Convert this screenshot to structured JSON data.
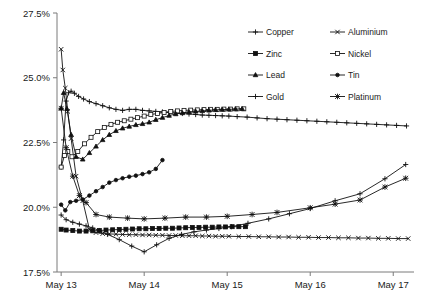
{
  "chart_data": {
    "type": "line",
    "title": "",
    "subtitle": "",
    "xlabel": "",
    "ylabel": "",
    "grid": false,
    "legend_position": "top-right",
    "legend_columns": 2,
    "x_tick_labels": [
      "May 13",
      "May 14",
      "May 15",
      "May 16",
      "May 17"
    ],
    "x_tick_values": [
      13,
      14,
      15,
      16,
      17
    ],
    "xlim": [
      12.95,
      17.25
    ],
    "y_tick_labels": [
      "17.5%",
      "20.0%",
      "22.5%",
      "25.0%",
      "27.5%"
    ],
    "y_tick_values": [
      17.5,
      20.0,
      22.5,
      25.0,
      27.5
    ],
    "ylim": [
      17.5,
      27.5
    ],
    "y_unit": "%",
    "series": [
      {
        "name": "Copper",
        "marker": "plus",
        "x": [
          13.0,
          13.03,
          13.06,
          13.09,
          13.12,
          13.16,
          13.21,
          13.27,
          13.34,
          13.42,
          13.5,
          13.58,
          13.66,
          13.74,
          13.82,
          13.9,
          13.98,
          14.06,
          14.14,
          14.22,
          14.3,
          14.38,
          14.46,
          14.54,
          14.62,
          14.7,
          14.78,
          14.86,
          14.94,
          15.02,
          15.12,
          15.24,
          15.36,
          15.48,
          15.6,
          15.72,
          15.84,
          15.96,
          16.08,
          16.2,
          16.32,
          16.44,
          16.56,
          16.68,
          16.8,
          16.92,
          17.04,
          17.16
        ],
        "y": [
          21.55,
          22.6,
          24.1,
          24.42,
          24.48,
          24.4,
          24.28,
          24.18,
          24.08,
          24.0,
          23.92,
          23.84,
          23.78,
          23.74,
          23.78,
          23.78,
          23.74,
          23.72,
          23.7,
          23.68,
          23.66,
          23.64,
          23.62,
          23.6,
          23.58,
          23.56,
          23.55,
          23.54,
          23.53,
          23.52,
          23.5,
          23.48,
          23.45,
          23.42,
          23.4,
          23.38,
          23.36,
          23.34,
          23.32,
          23.3,
          23.28,
          23.26,
          23.24,
          23.22,
          23.2,
          23.18,
          23.16,
          23.14
        ]
      },
      {
        "name": "Aluminium",
        "marker": "cross",
        "x": [
          13.0,
          13.02,
          13.05,
          13.08,
          13.12,
          13.18,
          13.26,
          13.34,
          13.42,
          13.5,
          13.58,
          13.66,
          13.74,
          13.82,
          13.9,
          13.98,
          14.06,
          14.14,
          14.22,
          14.3,
          14.38,
          14.46,
          14.54,
          14.62,
          14.7,
          14.78,
          14.86,
          14.94,
          15.02,
          15.14,
          15.26,
          15.38,
          15.5,
          15.62,
          15.74,
          15.86,
          15.98,
          16.1,
          16.22,
          16.34,
          16.46,
          16.58,
          16.7,
          16.82,
          16.94,
          17.06,
          17.18
        ],
        "y": [
          26.1,
          25.3,
          24.6,
          23.7,
          22.65,
          21.2,
          20.25,
          19.15,
          19.02,
          18.98,
          18.97,
          18.96,
          18.95,
          18.94,
          18.94,
          18.93,
          18.93,
          18.92,
          18.92,
          18.91,
          18.91,
          18.9,
          18.9,
          18.9,
          18.89,
          18.89,
          18.88,
          18.88,
          18.88,
          18.87,
          18.87,
          18.86,
          18.86,
          18.85,
          18.85,
          18.84,
          18.84,
          18.83,
          18.83,
          18.82,
          18.82,
          18.81,
          18.81,
          18.8,
          18.8,
          18.79,
          18.79
        ]
      },
      {
        "name": "Zinc",
        "marker": "square",
        "x": [
          13.0,
          13.06,
          13.14,
          13.22,
          13.3,
          13.38,
          13.46,
          13.54,
          13.62,
          13.7,
          13.78,
          13.86,
          13.94,
          14.02,
          14.1,
          14.18,
          14.26,
          14.34,
          14.42,
          14.5,
          14.58,
          14.66,
          14.74,
          14.82,
          14.9,
          14.98,
          15.06,
          15.14,
          15.22
        ],
        "y": [
          19.15,
          19.12,
          19.1,
          19.08,
          19.08,
          19.09,
          19.1,
          19.12,
          19.13,
          19.14,
          19.15,
          19.16,
          19.17,
          19.17,
          19.18,
          19.18,
          19.19,
          19.19,
          19.2,
          19.21,
          19.22,
          19.22,
          19.23,
          19.23,
          19.24,
          19.24,
          19.25,
          19.25,
          19.25
        ]
      },
      {
        "name": "Nickel",
        "marker": "square-hollow",
        "x": [
          13.0,
          13.04,
          13.08,
          13.13,
          13.2,
          13.28,
          13.36,
          13.44,
          13.52,
          13.6,
          13.68,
          13.76,
          13.84,
          13.92,
          14.0,
          14.08,
          14.16,
          14.24,
          14.32,
          14.4,
          14.48,
          14.56,
          14.64,
          14.72,
          14.8,
          14.88,
          14.96,
          15.04,
          15.12,
          15.2
        ],
        "y": [
          21.55,
          22.0,
          22.15,
          21.95,
          22.15,
          22.45,
          22.7,
          22.92,
          23.08,
          23.2,
          23.28,
          23.34,
          23.4,
          23.46,
          23.52,
          23.58,
          23.62,
          23.66,
          23.7,
          23.72,
          23.74,
          23.75,
          23.76,
          23.77,
          23.78,
          23.78,
          23.79,
          23.79,
          23.8,
          23.8
        ]
      },
      {
        "name": "Lead",
        "marker": "triangle",
        "x": [
          13.0,
          13.03,
          13.07,
          13.12,
          13.18,
          13.26,
          13.34,
          13.42,
          13.5,
          13.58,
          13.66,
          13.74,
          13.82,
          13.9,
          13.98,
          14.06,
          14.14,
          14.22,
          14.3,
          14.38,
          14.46,
          14.54,
          14.62,
          14.7,
          14.78,
          14.86,
          14.94,
          15.02,
          15.1,
          15.18
        ],
        "y": [
          23.82,
          24.42,
          23.8,
          22.8,
          21.95,
          21.85,
          22.1,
          22.35,
          22.6,
          22.8,
          22.95,
          23.05,
          23.12,
          23.18,
          23.22,
          23.28,
          23.38,
          23.46,
          23.54,
          23.6,
          23.64,
          23.68,
          23.7,
          23.72,
          23.74,
          23.76,
          23.77,
          23.78,
          23.79,
          23.8
        ]
      },
      {
        "name": "Tin",
        "marker": "circle",
        "x": [
          13.0,
          13.05,
          13.11,
          13.18,
          13.26,
          13.34,
          13.42,
          13.5,
          13.58,
          13.66,
          13.74,
          13.82,
          13.9,
          13.98,
          14.06,
          14.14,
          14.22
        ],
        "y": [
          20.1,
          19.88,
          20.2,
          20.25,
          20.3,
          20.45,
          20.62,
          20.78,
          20.95,
          21.05,
          21.12,
          21.18,
          21.22,
          21.28,
          21.35,
          21.48,
          21.82
        ]
      },
      {
        "name": "Gold",
        "marker": "plus-thin",
        "x": [
          13.0,
          13.06,
          13.14,
          13.22,
          13.3,
          13.38,
          13.46,
          13.56,
          13.7,
          13.85,
          14.0,
          14.15,
          14.3,
          14.45,
          14.6,
          14.75,
          14.9,
          15.05,
          15.25,
          15.5,
          15.75,
          16.0,
          16.3,
          16.6,
          16.9,
          17.15
        ],
        "y": [
          19.7,
          19.52,
          19.42,
          19.35,
          19.28,
          19.2,
          19.1,
          18.95,
          18.75,
          18.5,
          18.28,
          18.55,
          18.8,
          18.95,
          19.05,
          19.12,
          19.18,
          19.25,
          19.38,
          19.55,
          19.75,
          19.95,
          20.25,
          20.52,
          21.1,
          21.65
        ]
      },
      {
        "name": "Platinum",
        "marker": "star",
        "x": [
          13.0,
          13.06,
          13.14,
          13.22,
          13.3,
          13.42,
          13.58,
          13.8,
          14.0,
          14.25,
          14.5,
          14.75,
          15.0,
          15.3,
          15.6,
          16.0,
          16.3,
          16.6,
          16.9,
          17.15
        ],
        "y": [
          23.82,
          22.3,
          21.2,
          20.45,
          20.18,
          19.72,
          19.62,
          19.58,
          19.55,
          19.58,
          19.62,
          19.62,
          19.65,
          19.72,
          19.8,
          19.98,
          20.12,
          20.28,
          20.78,
          21.12
        ]
      }
    ]
  },
  "legend": {
    "entries": [
      {
        "label": "Copper",
        "marker": "plus",
        "col": 0,
        "row": 0
      },
      {
        "label": "Aluminium",
        "marker": "cross",
        "col": 1,
        "row": 0
      },
      {
        "label": "Zinc",
        "marker": "square",
        "col": 0,
        "row": 1
      },
      {
        "label": "Nickel",
        "marker": "square-hollow",
        "col": 1,
        "row": 1
      },
      {
        "label": "Lead",
        "marker": "triangle",
        "col": 0,
        "row": 2
      },
      {
        "label": "Tin",
        "marker": "circle",
        "col": 1,
        "row": 2
      },
      {
        "label": "Gold",
        "marker": "plus-thin",
        "col": 0,
        "row": 3
      },
      {
        "label": "Platinum",
        "marker": "star",
        "col": 1,
        "row": 3
      }
    ]
  },
  "colors": {
    "series_stroke": "#111111",
    "axis": "#7a7a7a",
    "text": "#1a1a1a",
    "background": "#ffffff"
  }
}
